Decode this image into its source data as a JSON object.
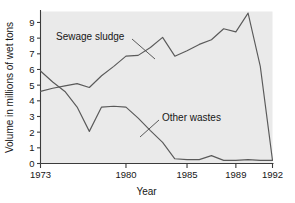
{
  "chart_data": {
    "type": "line",
    "title": "",
    "xlabel": "Year",
    "ylabel": "Volume in millions of wet tons",
    "xlim": [
      1973,
      1992
    ],
    "ylim": [
      0,
      9.7
    ],
    "grid": false,
    "legend_position": "inline-annotations",
    "background": "#eaeaea",
    "line_color": "#5a5a5a",
    "axis_color": "#3c3c3c",
    "xticks": [
      1973,
      1980,
      1985,
      1989,
      1992
    ],
    "xtick_labels": [
      "1973",
      "1980",
      "1985",
      "1989",
      "1992"
    ],
    "xticks_minor": [
      1974,
      1975,
      1976,
      1977,
      1978,
      1979,
      1981,
      1982,
      1983,
      1984,
      1986,
      1987,
      1988,
      1990,
      1991
    ],
    "yticks": [
      0,
      1,
      2,
      3,
      4,
      5,
      6,
      7,
      8,
      9
    ],
    "ytick_labels": [
      "0",
      "1",
      "2",
      "3",
      "4",
      "5",
      "6",
      "7",
      "8",
      "9"
    ],
    "x": [
      1973,
      1974,
      1975,
      1976,
      1977,
      1978,
      1979,
      1980,
      1981,
      1982,
      1983,
      1984,
      1985,
      1986,
      1987,
      1988,
      1989,
      1990,
      1991,
      1992
    ],
    "series": [
      {
        "name": "Sewage sludge",
        "values": [
          4.6,
          4.8,
          4.95,
          5.1,
          4.85,
          5.6,
          6.2,
          6.85,
          6.9,
          7.4,
          8.05,
          6.85,
          7.2,
          7.6,
          7.9,
          8.6,
          8.4,
          9.6,
          6.2,
          0.2
        ],
        "color": "#5a5a5a"
      },
      {
        "name": "Other wastes",
        "values": [
          5.9,
          5.2,
          4.6,
          3.6,
          2.05,
          3.6,
          3.65,
          3.6,
          2.9,
          2.1,
          1.35,
          0.3,
          0.25,
          0.25,
          0.5,
          0.2,
          0.2,
          0.25,
          0.2,
          0.2
        ],
        "color": "#5a5a5a"
      }
    ],
    "annotations": [
      {
        "text": "Sewage sludge",
        "series": "Sewage sludge",
        "text_x": 56,
        "text_y": 40,
        "leader_from_x": 132,
        "leader_from_y": 39,
        "leader_to_x": 155,
        "leader_to_y": 59
      },
      {
        "text": "Other wastes",
        "series": "Other wastes",
        "text_x": 162,
        "text_y": 121,
        "leader_from_x": 159,
        "leader_from_y": 120,
        "leader_to_x": 140,
        "leader_to_y": 137
      }
    ]
  }
}
